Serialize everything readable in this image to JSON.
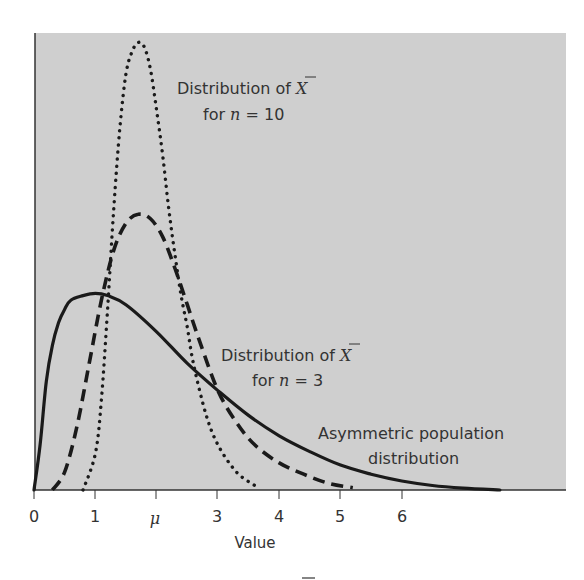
{
  "chart_data": {
    "type": "line",
    "title": "",
    "xlabel": "Value",
    "ylabel": "",
    "xlim": [
      0,
      8.65
    ],
    "ylim": [
      0,
      1.0
    ],
    "grid": false,
    "legend": "inline annotations",
    "x_ticks": [
      {
        "value": 0,
        "label": "0"
      },
      {
        "value": 1,
        "label": "1"
      },
      {
        "value": 2,
        "label": "μ"
      },
      {
        "value": 3,
        "label": "3"
      },
      {
        "value": 4,
        "label": "4"
      },
      {
        "value": 5,
        "label": "5"
      },
      {
        "value": 6,
        "label": "6"
      }
    ],
    "series": [
      {
        "name": "Asymmetric population distribution",
        "style": "solid",
        "x": [
          0.0,
          0.1,
          0.2,
          0.3,
          0.4,
          0.5,
          0.6,
          0.8,
          1.0,
          1.2,
          1.5,
          2.0,
          2.5,
          3.0,
          3.5,
          4.0,
          4.5,
          5.0,
          5.5,
          6.0,
          6.5,
          7.0,
          7.6
        ],
        "y": [
          0.0,
          0.1,
          0.24,
          0.32,
          0.37,
          0.4,
          0.42,
          0.43,
          0.435,
          0.43,
          0.41,
          0.35,
          0.28,
          0.22,
          0.165,
          0.12,
          0.085,
          0.055,
          0.035,
          0.02,
          0.01,
          0.004,
          0.0
        ]
      },
      {
        "name": "Distribution of X̄ for n = 3",
        "style": "dashed",
        "x": [
          0.3,
          0.5,
          0.7,
          0.9,
          1.1,
          1.3,
          1.5,
          1.7,
          1.9,
          2.1,
          2.3,
          2.5,
          2.7,
          3.0,
          3.3,
          3.6,
          4.0,
          4.4,
          4.8,
          5.2
        ],
        "y": [
          0.0,
          0.04,
          0.14,
          0.28,
          0.42,
          0.53,
          0.59,
          0.61,
          0.6,
          0.56,
          0.49,
          0.41,
          0.33,
          0.22,
          0.15,
          0.1,
          0.06,
          0.035,
          0.015,
          0.005
        ]
      },
      {
        "name": "Distribution of X̄ for n = 10",
        "style": "dotted",
        "x": [
          0.8,
          1.0,
          1.1,
          1.2,
          1.3,
          1.4,
          1.5,
          1.6,
          1.7,
          1.8,
          1.9,
          2.0,
          2.1,
          2.2,
          2.3,
          2.4,
          2.5,
          2.6,
          2.8,
          3.0,
          3.3,
          3.6
        ],
        "y": [
          0.0,
          0.08,
          0.2,
          0.4,
          0.62,
          0.8,
          0.92,
          0.97,
          0.99,
          0.98,
          0.93,
          0.84,
          0.74,
          0.62,
          0.52,
          0.43,
          0.36,
          0.28,
          0.17,
          0.1,
          0.04,
          0.01
        ]
      }
    ],
    "annotations": [
      {
        "line1": "Distribution of X̄",
        "line2": "for n = 10",
        "series": "dotted"
      },
      {
        "line1": "Distribution of X̄",
        "line2": "for n = 3",
        "series": "dashed"
      },
      {
        "line1": "Asymmetric population",
        "line2": "distribution",
        "series": "solid"
      }
    ]
  },
  "labels": {
    "n10_line1": "Distribution of ",
    "n10_xbar": "X",
    "n10_for": "for ",
    "n10_n": "n",
    "n10_eq": " = 10",
    "n3_line1": "Distribution of ",
    "n3_xbar": "X",
    "n3_for": "for ",
    "n3_n": "n",
    "n3_eq": " = 3",
    "pop_line1": "Asymmetric population",
    "pop_line2": "distribution",
    "xlabel": "Value",
    "tick0": "0",
    "tick1": "1",
    "tick2": "μ",
    "tick3": "3",
    "tick4": "4",
    "tick5": "5",
    "tick6": "6"
  },
  "colors": {
    "plot_bg": "#cfcfcf",
    "curve": "#1a1a1a",
    "text": "#333333"
  }
}
